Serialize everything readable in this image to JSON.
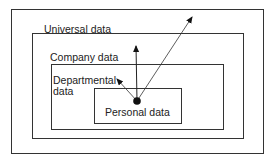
{
  "diagram": {
    "labels": {
      "universal": "Universal data",
      "company": "Company data",
      "departmental_line1": "Departmental",
      "departmental_line2": "data",
      "personal": "Personal data"
    },
    "colors": {
      "line": "#333333",
      "background": "#ffffff"
    },
    "boxes": [
      {
        "name": "outer-frame",
        "x": 11,
        "y": 9,
        "w": 252,
        "h": 144
      },
      {
        "name": "universal",
        "x": 32,
        "y": 33,
        "w": 211,
        "h": 105
      },
      {
        "name": "company",
        "x": 51,
        "y": 64,
        "w": 172,
        "h": 65
      },
      {
        "name": "personal",
        "x": 94,
        "y": 88,
        "w": 87,
        "h": 35
      }
    ],
    "arrows": [
      {
        "name": "to-universal",
        "from": [
          137,
          101
        ],
        "to": [
          193,
          15
        ]
      },
      {
        "name": "to-company",
        "from": [
          137,
          101
        ],
        "to": [
          136,
          43
        ]
      },
      {
        "name": "to-departmental",
        "from": [
          137,
          101
        ],
        "to": [
          115,
          77
        ]
      }
    ]
  }
}
